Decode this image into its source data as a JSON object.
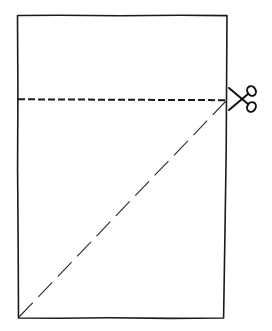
{
  "diagram": {
    "type": "paper-folding-instruction",
    "description": "Rectangular sheet with a dashed horizontal cut line near the top and a long-dash diagonal fold line from the bottom-left corner to the right end of the cut line; scissors icon marks the cut.",
    "colors": {
      "background": "#ffffff",
      "stroke": "#1a1a1a",
      "fold_stroke": "#2a2a2a"
    },
    "sheet": {
      "top_left": [
        17,
        15
      ],
      "top_right": [
        227,
        15
      ],
      "bottom_right": [
        223,
        318
      ],
      "bottom_left": [
        18,
        318
      ]
    },
    "cut_line": {
      "style": "dashed",
      "from": [
        18,
        99
      ],
      "to": [
        226,
        100
      ],
      "dash": [
        7,
        3
      ]
    },
    "fold_line": {
      "style": "long-dash",
      "from": [
        19,
        317
      ],
      "to": [
        226,
        101
      ],
      "dash": [
        20,
        8
      ]
    },
    "icons": {
      "scissors": {
        "name": "scissors-icon",
        "pivot": [
          240,
          99
        ]
      }
    }
  }
}
